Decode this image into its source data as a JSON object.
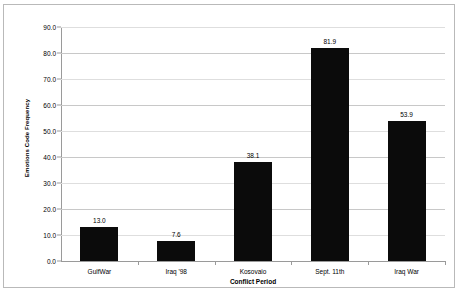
{
  "chart_data": {
    "type": "bar",
    "title": "",
    "xlabel": "Conflict Period",
    "ylabel": "Emotions Code Frequency",
    "categories": [
      "GulfWar",
      "Iraq '98",
      "Kosovaio",
      "Sept. 11th",
      "Iraq War"
    ],
    "values": [
      13.0,
      7.6,
      38.1,
      81.9,
      53.9
    ],
    "value_labels": [
      "13.0",
      "7.6",
      "38.1",
      "81.9",
      "53.9"
    ],
    "ylim": [
      0,
      90
    ],
    "ytick_labels": [
      "90.0",
      "80.0",
      "70.0",
      "60.0",
      "50.0",
      "40.0",
      "30.0",
      "20.0",
      "10.0",
      "0.0"
    ],
    "ytick_values": [
      90,
      80,
      70,
      60,
      50,
      40,
      30,
      20,
      10,
      0
    ],
    "grid": true,
    "legend": false,
    "bar_color": "#0b0b0b",
    "grid_color": "#c8c8c8",
    "axis_color": "#9a9a9a",
    "frame_color": "#b9b9b9",
    "background": "#ffffff"
  }
}
